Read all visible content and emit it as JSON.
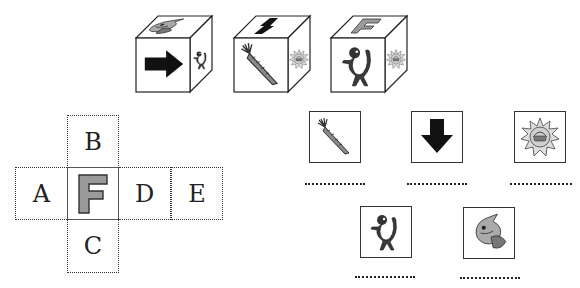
{
  "exercise": {
    "cubes": [
      {
        "id": 1,
        "front": "right-arrow",
        "top": "fish",
        "side": "creature"
      },
      {
        "id": 2,
        "front": "carrot",
        "top": "up-arrow",
        "side": "sun"
      },
      {
        "id": 3,
        "front": "creature",
        "top": "letter-F",
        "side": "sun"
      }
    ],
    "net": {
      "cells": [
        {
          "label": "B",
          "position": "top"
        },
        {
          "label": "A",
          "position": "left"
        },
        {
          "label": "F",
          "position": "center"
        },
        {
          "label": "D",
          "position": "right-1"
        },
        {
          "label": "E",
          "position": "right-2"
        },
        {
          "label": "C",
          "position": "bottom"
        }
      ],
      "center_glyph": "F",
      "center_glyph_color": "#9a9a9a"
    },
    "options": [
      {
        "icon": "carrot",
        "answer": ""
      },
      {
        "icon": "down-arrow",
        "answer": ""
      },
      {
        "icon": "sun",
        "answer": ""
      },
      {
        "icon": "creature",
        "answer": ""
      },
      {
        "icon": "fish",
        "answer": ""
      }
    ]
  }
}
